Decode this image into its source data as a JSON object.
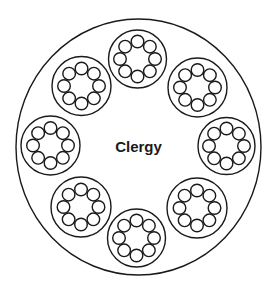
{
  "diagram": {
    "center_label": "Clergy",
    "outer_circle": {
      "cx": 138.5,
      "cy": 147,
      "rx": 122.5,
      "ry": 128
    },
    "groups": [
      {
        "cx": 137.5,
        "cy": 59,
        "r": 29
      },
      {
        "cx": 197.5,
        "cy": 87.5,
        "r": 29.5
      },
      {
        "cx": 226.5,
        "cy": 146,
        "r": 28.5
      },
      {
        "cx": 197,
        "cy": 208,
        "r": 30
      },
      {
        "cx": 136.5,
        "cy": 238,
        "r": 29
      },
      {
        "cx": 81,
        "cy": 207,
        "r": 30
      },
      {
        "cx": 50.5,
        "cy": 145.5,
        "r": 29.5
      },
      {
        "cx": 81.5,
        "cy": 86,
        "r": 29.5
      }
    ],
    "members_per_group": 8,
    "member_ring_radius": 17.5,
    "member_radius": 6.3,
    "stroke_color": "#1a1a1a"
  }
}
